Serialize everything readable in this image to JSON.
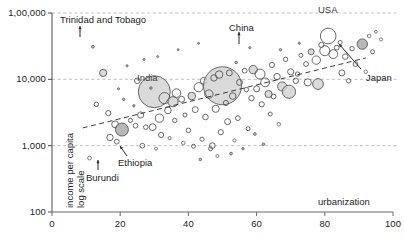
{
  "chart_data": {
    "type": "scatter",
    "title": "",
    "subtitle": "",
    "xlabel": "urbanization",
    "ylabel": "income per capita\nlog scale",
    "ylabel_line1": "income per capita",
    "ylabel_line2": "log scale",
    "xlim": [
      0,
      100
    ],
    "ylim": [
      100,
      100000
    ],
    "yscale": "log",
    "xscale": "linear",
    "xticks": [
      0,
      20,
      40,
      60,
      80,
      100
    ],
    "xtick_labels": [
      "0",
      "20",
      "40",
      "60",
      "80",
      "100"
    ],
    "yticks": [
      100,
      1000,
      10000,
      100000
    ],
    "ytick_labels": [
      "100",
      "1,000",
      "10,000",
      "1,00,000"
    ],
    "grid": "horizontal dashed gridlines at 1,000 / 10,000 / 1,00,000",
    "legend": "none",
    "bubble_encoding": "bubble area encodes population",
    "trendline": {
      "style": "dashed",
      "x_start": 9,
      "y_start": 1850,
      "x_end": 92,
      "y_end": 21000
    },
    "annotations": [
      {
        "label": "Trinidad and Tobago",
        "x": 12,
        "y": 30000,
        "label_x": 20,
        "label_y": 52000
      },
      {
        "label": "India",
        "x": 30,
        "y": 6500,
        "label_x": 30,
        "label_y": 6500
      },
      {
        "label": "China",
        "x": 50,
        "y": 8000,
        "label_x": 48,
        "label_y": 38000
      },
      {
        "label": "USA",
        "x": 81,
        "y": 45000,
        "label_x": 84,
        "label_y": 80000
      },
      {
        "label": "Japan",
        "x": 91,
        "y": 34000,
        "label_x": 96,
        "label_y": 9500
      },
      {
        "label": "Ethiopia",
        "x": 17,
        "y": 1350,
        "label_x": 24,
        "label_y": 830
      },
      {
        "label": "Burundi",
        "x": 11,
        "y": 640,
        "label_x": 13,
        "label_y": 380
      }
    ],
    "points": [
      {
        "x": 12.0,
        "y": 31000,
        "r": 1.4,
        "fill": "dark"
      },
      {
        "x": 15.0,
        "y": 12500,
        "r": 3.6,
        "fill": "light"
      },
      {
        "x": 13.0,
        "y": 4200,
        "r": 2.2,
        "fill": "none"
      },
      {
        "x": 16.5,
        "y": 3100,
        "r": 2.6,
        "fill": "none"
      },
      {
        "x": 18.5,
        "y": 2100,
        "r": 3.4,
        "fill": "none"
      },
      {
        "x": 20.5,
        "y": 1750,
        "r": 6.5,
        "fill": "dark"
      },
      {
        "x": 17.0,
        "y": 1330,
        "r": 3.2,
        "fill": "none"
      },
      {
        "x": 19.0,
        "y": 1150,
        "r": 2.4,
        "fill": "none"
      },
      {
        "x": 11.0,
        "y": 650,
        "r": 1.9,
        "fill": "none"
      },
      {
        "x": 23.0,
        "y": 2400,
        "r": 2.1,
        "fill": "none"
      },
      {
        "x": 24.5,
        "y": 2000,
        "r": 2.4,
        "fill": "none"
      },
      {
        "x": 26.0,
        "y": 2900,
        "r": 3.1,
        "fill": "none"
      },
      {
        "x": 27.5,
        "y": 1900,
        "r": 2.3,
        "fill": "none"
      },
      {
        "x": 30.0,
        "y": 6500,
        "r": 16.0,
        "fill": "light"
      },
      {
        "x": 29.0,
        "y": 7400,
        "r": 1.3,
        "fill": "dark"
      },
      {
        "x": 25.0,
        "y": 9500,
        "r": 2.8,
        "fill": "none"
      },
      {
        "x": 22.0,
        "y": 16000,
        "r": 1.1,
        "fill": "dark"
      },
      {
        "x": 27.0,
        "y": 20000,
        "r": 1.1,
        "fill": "dark"
      },
      {
        "x": 33.0,
        "y": 5200,
        "r": 5.6,
        "fill": "none"
      },
      {
        "x": 35.5,
        "y": 4600,
        "r": 5.1,
        "fill": "light"
      },
      {
        "x": 34.0,
        "y": 3400,
        "r": 3.3,
        "fill": "none"
      },
      {
        "x": 36.5,
        "y": 6200,
        "r": 4.3,
        "fill": "none"
      },
      {
        "x": 38.0,
        "y": 5000,
        "r": 3.0,
        "fill": "none"
      },
      {
        "x": 31.5,
        "y": 2600,
        "r": 4.1,
        "fill": "none"
      },
      {
        "x": 29.5,
        "y": 1900,
        "r": 3.4,
        "fill": "none"
      },
      {
        "x": 32.0,
        "y": 1450,
        "r": 2.6,
        "fill": "none"
      },
      {
        "x": 36.0,
        "y": 2400,
        "r": 2.2,
        "fill": "none"
      },
      {
        "x": 39.0,
        "y": 2900,
        "r": 2.0,
        "fill": "none"
      },
      {
        "x": 41.0,
        "y": 5600,
        "r": 3.8,
        "fill": "light"
      },
      {
        "x": 43.0,
        "y": 7600,
        "r": 4.6,
        "fill": "none"
      },
      {
        "x": 44.5,
        "y": 9500,
        "r": 3.4,
        "fill": "none"
      },
      {
        "x": 42.0,
        "y": 3500,
        "r": 3.0,
        "fill": "none"
      },
      {
        "x": 45.0,
        "y": 2700,
        "r": 2.8,
        "fill": "none"
      },
      {
        "x": 40.0,
        "y": 1700,
        "r": 2.3,
        "fill": "none"
      },
      {
        "x": 44.0,
        "y": 1250,
        "r": 2.1,
        "fill": "none"
      },
      {
        "x": 47.0,
        "y": 1000,
        "r": 2.9,
        "fill": "none"
      },
      {
        "x": 50.0,
        "y": 8000,
        "r": 19.0,
        "fill": "light"
      },
      {
        "x": 47.5,
        "y": 10500,
        "r": 3.2,
        "fill": "none"
      },
      {
        "x": 49.0,
        "y": 11800,
        "r": 3.8,
        "fill": "none"
      },
      {
        "x": 52.0,
        "y": 12500,
        "r": 3.0,
        "fill": "none"
      },
      {
        "x": 46.0,
        "y": 6000,
        "r": 4.2,
        "fill": "none"
      },
      {
        "x": 53.0,
        "y": 5600,
        "r": 3.3,
        "fill": "none"
      },
      {
        "x": 51.0,
        "y": 4400,
        "r": 2.6,
        "fill": "none"
      },
      {
        "x": 48.0,
        "y": 3600,
        "r": 3.6,
        "fill": "none"
      },
      {
        "x": 55.0,
        "y": 9000,
        "r": 3.0,
        "fill": "none"
      },
      {
        "x": 56.5,
        "y": 13500,
        "r": 2.4,
        "fill": "none"
      },
      {
        "x": 54.0,
        "y": 18000,
        "r": 1.3,
        "fill": "dark"
      },
      {
        "x": 57.0,
        "y": 7000,
        "r": 2.2,
        "fill": "none"
      },
      {
        "x": 58.5,
        "y": 5200,
        "r": 2.7,
        "fill": "none"
      },
      {
        "x": 54.5,
        "y": 2600,
        "r": 2.4,
        "fill": "none"
      },
      {
        "x": 57.5,
        "y": 1800,
        "r": 2.0,
        "fill": "none"
      },
      {
        "x": 53.5,
        "y": 1200,
        "r": 1.6,
        "fill": "none"
      },
      {
        "x": 59.0,
        "y": 14000,
        "r": 4.2,
        "fill": "light"
      },
      {
        "x": 61.0,
        "y": 12000,
        "r": 5.0,
        "fill": "none"
      },
      {
        "x": 62.5,
        "y": 9000,
        "r": 4.4,
        "fill": "none"
      },
      {
        "x": 60.0,
        "y": 7200,
        "r": 3.0,
        "fill": "none"
      },
      {
        "x": 63.5,
        "y": 6000,
        "r": 3.6,
        "fill": "light"
      },
      {
        "x": 61.5,
        "y": 4200,
        "r": 2.6,
        "fill": "none"
      },
      {
        "x": 64.5,
        "y": 16500,
        "r": 2.6,
        "fill": "none"
      },
      {
        "x": 66.0,
        "y": 11000,
        "r": 3.2,
        "fill": "none"
      },
      {
        "x": 67.5,
        "y": 7800,
        "r": 4.6,
        "fill": "light"
      },
      {
        "x": 65.0,
        "y": 5500,
        "r": 2.4,
        "fill": "none"
      },
      {
        "x": 68.5,
        "y": 20000,
        "r": 2.2,
        "fill": "none"
      },
      {
        "x": 70.0,
        "y": 13000,
        "r": 3.1,
        "fill": "none"
      },
      {
        "x": 71.5,
        "y": 9500,
        "r": 2.7,
        "fill": "none"
      },
      {
        "x": 69.5,
        "y": 6500,
        "r": 6.6,
        "fill": "light"
      },
      {
        "x": 73.0,
        "y": 23000,
        "r": 2.0,
        "fill": "none"
      },
      {
        "x": 74.5,
        "y": 17000,
        "r": 2.4,
        "fill": "none"
      },
      {
        "x": 72.0,
        "y": 12000,
        "r": 2.2,
        "fill": "none"
      },
      {
        "x": 76.0,
        "y": 26000,
        "r": 3.0,
        "fill": "light"
      },
      {
        "x": 77.5,
        "y": 19500,
        "r": 4.2,
        "fill": "none"
      },
      {
        "x": 75.0,
        "y": 9000,
        "r": 3.6,
        "fill": "none"
      },
      {
        "x": 79.0,
        "y": 33000,
        "r": 2.6,
        "fill": "none"
      },
      {
        "x": 81.0,
        "y": 45000,
        "r": 7.8,
        "fill": "none"
      },
      {
        "x": 80.0,
        "y": 27000,
        "r": 5.0,
        "fill": "none"
      },
      {
        "x": 82.5,
        "y": 24000,
        "r": 4.4,
        "fill": "none"
      },
      {
        "x": 83.5,
        "y": 30000,
        "r": 2.4,
        "fill": "none"
      },
      {
        "x": 84.5,
        "y": 36000,
        "r": 2.0,
        "fill": "none"
      },
      {
        "x": 78.0,
        "y": 8500,
        "r": 5.4,
        "fill": "light"
      },
      {
        "x": 86.0,
        "y": 22000,
        "r": 2.8,
        "fill": "none"
      },
      {
        "x": 88.0,
        "y": 29000,
        "r": 2.2,
        "fill": "none"
      },
      {
        "x": 91.0,
        "y": 34000,
        "r": 5.2,
        "fill": "dark"
      },
      {
        "x": 93.0,
        "y": 45000,
        "r": 1.8,
        "fill": "none"
      },
      {
        "x": 95.0,
        "y": 52000,
        "r": 1.4,
        "fill": "none"
      },
      {
        "x": 96.5,
        "y": 40000,
        "r": 1.6,
        "fill": "none"
      },
      {
        "x": 94.0,
        "y": 26000,
        "r": 2.0,
        "fill": "none"
      },
      {
        "x": 89.0,
        "y": 17000,
        "r": 2.4,
        "fill": "none"
      },
      {
        "x": 92.0,
        "y": 13000,
        "r": 1.7,
        "fill": "none"
      },
      {
        "x": 85.0,
        "y": 12500,
        "r": 3.0,
        "fill": "none"
      },
      {
        "x": 87.0,
        "y": 9500,
        "r": 2.2,
        "fill": "none"
      },
      {
        "x": 64.0,
        "y": 3000,
        "r": 2.0,
        "fill": "none"
      },
      {
        "x": 66.5,
        "y": 2100,
        "r": 1.8,
        "fill": "none"
      },
      {
        "x": 59.5,
        "y": 1500,
        "r": 1.4,
        "fill": "dark"
      },
      {
        "x": 62.0,
        "y": 1050,
        "r": 1.3,
        "fill": "dark"
      },
      {
        "x": 56.0,
        "y": 900,
        "r": 1.2,
        "fill": "dark"
      },
      {
        "x": 48.5,
        "y": 700,
        "r": 1.5,
        "fill": "none"
      },
      {
        "x": 43.5,
        "y": 620,
        "r": 1.3,
        "fill": "dark"
      },
      {
        "x": 51.5,
        "y": 2300,
        "r": 3.0,
        "fill": "none"
      },
      {
        "x": 49.5,
        "y": 1600,
        "r": 2.6,
        "fill": "none"
      },
      {
        "x": 38.5,
        "y": 1100,
        "r": 1.8,
        "fill": "none"
      },
      {
        "x": 41.5,
        "y": 980,
        "r": 2.0,
        "fill": "none"
      },
      {
        "x": 34.5,
        "y": 1300,
        "r": 1.6,
        "fill": "none"
      },
      {
        "x": 21.0,
        "y": 5000,
        "r": 1.2,
        "fill": "dark"
      },
      {
        "x": 19.5,
        "y": 7200,
        "r": 1.1,
        "fill": "dark"
      },
      {
        "x": 24.0,
        "y": 4000,
        "r": 1.2,
        "fill": "dark"
      },
      {
        "x": 31.0,
        "y": 22000,
        "r": 1.0,
        "fill": "dark"
      },
      {
        "x": 37.0,
        "y": 28000,
        "r": 1.0,
        "fill": "dark"
      },
      {
        "x": 43.0,
        "y": 35000,
        "r": 1.0,
        "fill": "dark"
      },
      {
        "x": 58.0,
        "y": 30000,
        "r": 1.1,
        "fill": "dark"
      },
      {
        "x": 67.0,
        "y": 28000,
        "r": 1.2,
        "fill": "dark"
      },
      {
        "x": 72.5,
        "y": 35000,
        "r": 1.1,
        "fill": "dark"
      },
      {
        "x": 46.5,
        "y": 900,
        "r": 2.0,
        "fill": "none"
      },
      {
        "x": 52.5,
        "y": 760,
        "r": 1.4,
        "fill": "dark"
      },
      {
        "x": 30.5,
        "y": 900,
        "r": 1.5,
        "fill": "none"
      },
      {
        "x": 26.5,
        "y": 1000,
        "r": 2.4,
        "fill": "none"
      }
    ]
  },
  "axis": {
    "x_title": "urbanization",
    "y_title_line1": "income per capita",
    "y_title_line2": "log scale"
  },
  "caption": ""
}
